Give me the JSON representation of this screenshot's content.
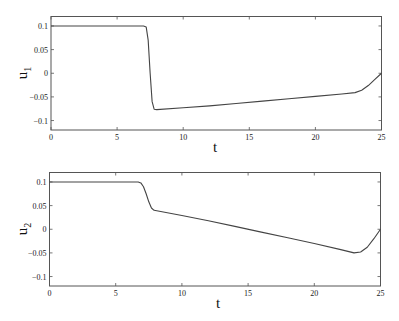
{
  "chart_data": [
    {
      "type": "line",
      "title": "",
      "xlabel": "t",
      "ylabel": "u_1",
      "ylabel_main": "u",
      "ylabel_sub": "1",
      "xlim": [
        0,
        25
      ],
      "ylim": [
        -0.12,
        0.12
      ],
      "xticks": [
        0,
        5,
        10,
        15,
        20,
        25
      ],
      "yticks": [
        0.1,
        0.05,
        0,
        -0.05,
        -0.1
      ],
      "xtick_labels": [
        "0",
        "5",
        "10",
        "15",
        "20",
        "25"
      ],
      "ytick_labels": [
        "0.1",
        "0.05",
        "0",
        "−0.05",
        "−0.1"
      ],
      "grid": false,
      "series": [
        {
          "name": "u1",
          "x": [
            0,
            7.0,
            7.2,
            7.35,
            7.5,
            7.65,
            7.8,
            8.0,
            10,
            12,
            14,
            16,
            18,
            20,
            22,
            23,
            23.5,
            24,
            24.5,
            25
          ],
          "values": [
            0.1,
            0.1,
            0.098,
            0.07,
            0.0,
            -0.06,
            -0.076,
            -0.077,
            -0.073,
            -0.069,
            -0.064,
            -0.059,
            -0.054,
            -0.049,
            -0.044,
            -0.041,
            -0.036,
            -0.026,
            -0.013,
            0.0
          ]
        }
      ]
    },
    {
      "type": "line",
      "title": "",
      "xlabel": "t",
      "ylabel": "u_2",
      "ylabel_main": "u",
      "ylabel_sub": "2",
      "xlim": [
        0,
        25
      ],
      "ylim": [
        -0.12,
        0.12
      ],
      "xticks": [
        0,
        5,
        10,
        15,
        20,
        25
      ],
      "yticks": [
        0.1,
        0.05,
        0,
        -0.05,
        -0.1
      ],
      "xtick_labels": [
        "0",
        "5",
        "10",
        "15",
        "20",
        "25"
      ],
      "ytick_labels": [
        "0.1",
        "0.05",
        "0",
        "−0.05",
        "−0.1"
      ],
      "grid": false,
      "series": [
        {
          "name": "u2",
          "x": [
            0,
            6.7,
            6.9,
            7.1,
            7.3,
            7.5,
            7.7,
            7.9,
            10,
            12,
            14,
            16,
            18,
            20,
            22,
            23,
            23.5,
            24,
            24.5,
            25
          ],
          "values": [
            0.1,
            0.1,
            0.098,
            0.09,
            0.075,
            0.058,
            0.045,
            0.04,
            0.029,
            0.018,
            0.006,
            -0.006,
            -0.018,
            -0.03,
            -0.043,
            -0.05,
            -0.048,
            -0.038,
            -0.02,
            0.0
          ]
        }
      ]
    }
  ]
}
